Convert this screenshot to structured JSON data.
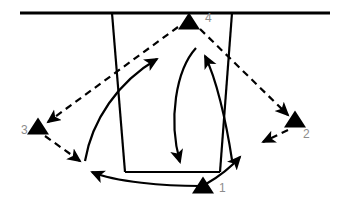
{
  "figure": {
    "title": "",
    "type": "schematic-diagram",
    "background_color": "#ffffff",
    "stroke_color": "#000000",
    "label_color": "#8c8c8c",
    "width": 338,
    "height": 207
  },
  "surface_line": {
    "name": "ground-surface-line",
    "x1": 20,
    "y1": 13,
    "x2": 330,
    "y2": 13,
    "stroke_width": 3
  },
  "funnel": {
    "name": "funnel-outline",
    "top_left": [
      112,
      13
    ],
    "top_right": [
      232,
      13
    ],
    "bottom_right": [
      220,
      172
    ],
    "bottom_left": [
      125,
      172
    ],
    "stroke_width": 2.2
  },
  "nodes": [
    {
      "id": "1",
      "label": "1",
      "marker": "triangle-up",
      "x": 203,
      "y": 187,
      "label_x": 219,
      "label_y": 192,
      "size": 11
    },
    {
      "id": "2",
      "label": "2",
      "marker": "triangle-up",
      "x": 295,
      "y": 121,
      "label_x": 303,
      "label_y": 138,
      "size": 11
    },
    {
      "id": "3",
      "label": "3",
      "marker": "triangle-up",
      "x": 38,
      "y": 128,
      "label_x": 21,
      "label_y": 134,
      "size": 11
    },
    {
      "id": "4",
      "label": "4",
      "marker": "triangle-up",
      "x": 189,
      "y": 23,
      "label_x": 205,
      "label_y": 22,
      "size": 11
    }
  ],
  "dashed_arrows": [
    {
      "name": "dashed-arrow-4-to-3",
      "from_node": "4",
      "to_node": "3",
      "path": "M 178 27 L 48 122",
      "dash": "7 5",
      "stroke_width": 2.2,
      "arrowhead_at": "end"
    },
    {
      "name": "dashed-arrow-4-to-2",
      "from_node": "4",
      "to_node": "2",
      "path": "M 200 29 L 288 115",
      "dash": "7 5",
      "stroke_width": 2.2,
      "arrowhead_at": "end"
    },
    {
      "name": "dashed-arrow-3-to-basin-left",
      "from_node": "3",
      "to_node": "basin-left",
      "path": "M 45 136 L 80 161",
      "dash": "7 5",
      "stroke_width": 2.2,
      "arrowhead_at": "end"
    },
    {
      "name": "dashed-arrow-2-to-basin-right",
      "from_node": "2",
      "to_node": "basin-right",
      "path": "M 288 130 L 263 142",
      "dash": "7 5",
      "stroke_width": 2.2,
      "arrowhead_at": "end"
    }
  ],
  "solid_arrows": [
    {
      "name": "solid-curve-basin-left-to-upper-mid",
      "path": "M 85 161 C 92 120, 118 82, 157 59",
      "stroke_width": 2.2,
      "arrowhead_at": "end"
    },
    {
      "name": "solid-curve-node4-down-to-basin-floor",
      "path": "M 196 48 C 176 70, 168 120, 180 162",
      "stroke_width": 2.2,
      "arrowhead_at": "end"
    },
    {
      "name": "solid-curve-basin-right-up-to-node4",
      "path": "M 232 160 C 226 120, 216 78, 205 56",
      "stroke_width": 2.2,
      "arrowhead_at": "end"
    },
    {
      "name": "solid-curve-node1-to-right-flank",
      "path": "M 206 184 C 220 176, 232 166, 240 157",
      "stroke_width": 2.2,
      "arrowhead_at": "end"
    },
    {
      "name": "solid-curve-node1-to-left-flank",
      "path": "M 200 186 C 165 186, 115 182, 92 172",
      "stroke_width": 2.2,
      "arrowhead_at": "end"
    }
  ]
}
